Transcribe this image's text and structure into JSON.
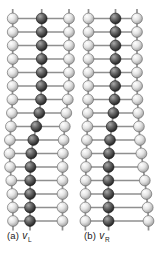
{
  "figure": {
    "width": 160,
    "height": 254,
    "sphere_radius": 5.4,
    "bond_width": 1.7,
    "stub_length": 9.5,
    "colors": {
      "background": "#ffffff",
      "bond": "#8f8f8f",
      "light_sphere_base": "#d9d9d9",
      "light_sphere_edge": "#5f5f5f",
      "dark_sphere_base": "#3a3a3a",
      "dark_sphere_edge": "#141414",
      "caption_text": "#1a1a1a"
    },
    "panels": [
      {
        "id": "a",
        "caption": {
          "prefix": "(a)",
          "symbol": "v",
          "subscript": "L"
        },
        "rungs": [
          {
            "y": 18.5,
            "left": 12.7,
            "dark": 41.7,
            "right": 69.0
          },
          {
            "y": 32.0,
            "left": 12.7,
            "dark": 41.7,
            "right": 69.0
          },
          {
            "y": 45.5,
            "left": 12.7,
            "dark": 41.7,
            "right": 69.0
          },
          {
            "y": 59.0,
            "left": 12.7,
            "dark": 41.7,
            "right": 69.0
          },
          {
            "y": 72.5,
            "left": 12.7,
            "dark": 41.7,
            "right": 69.0
          },
          {
            "y": 86.0,
            "left": 12.6,
            "dark": 41.5,
            "right": 68.9
          },
          {
            "y": 99.5,
            "left": 12.4,
            "dark": 41.0,
            "right": 67.8
          },
          {
            "y": 113.0,
            "left": 11.9,
            "dark": 39.3,
            "right": 66.3
          },
          {
            "y": 126.5,
            "left": 10.9,
            "dark": 36.3,
            "right": 64.8
          },
          {
            "y": 140.0,
            "left": 9.9,
            "dark": 33.3,
            "right": 63.6
          },
          {
            "y": 153.5,
            "left": 9.5,
            "dark": 31.3,
            "right": 62.9
          },
          {
            "y": 167.0,
            "left": 10.1,
            "dark": 30.5,
            "right": 62.6
          },
          {
            "y": 180.5,
            "left": 11.3,
            "dark": 30.2,
            "right": 62.5
          },
          {
            "y": 194.0,
            "left": 12.3,
            "dark": 30.1,
            "right": 62.5
          },
          {
            "y": 207.5,
            "left": 12.8,
            "dark": 30.0,
            "right": 62.5
          },
          {
            "y": 221.0,
            "left": 13.0,
            "dark": 30.0,
            "right": 62.5
          }
        ]
      },
      {
        "id": "b",
        "caption": {
          "prefix": "(b)",
          "symbol": "v",
          "subscript": "R"
        },
        "rungs": [
          {
            "y": 18.5,
            "left": 88.5,
            "dark": 115.5,
            "right": 137.0
          },
          {
            "y": 32.0,
            "left": 88.5,
            "dark": 115.5,
            "right": 137.0
          },
          {
            "y": 45.5,
            "left": 88.5,
            "dark": 115.5,
            "right": 137.0
          },
          {
            "y": 59.0,
            "left": 88.5,
            "dark": 115.5,
            "right": 137.0
          },
          {
            "y": 72.5,
            "left": 88.4,
            "dark": 115.4,
            "right": 137.0
          },
          {
            "y": 86.0,
            "left": 88.3,
            "dark": 115.2,
            "right": 137.1
          },
          {
            "y": 99.5,
            "left": 88.1,
            "dark": 114.6,
            "right": 137.4
          },
          {
            "y": 113.0,
            "left": 87.8,
            "dark": 113.4,
            "right": 138.2
          },
          {
            "y": 126.5,
            "left": 87.4,
            "dark": 111.7,
            "right": 138.9
          },
          {
            "y": 140.0,
            "left": 86.9,
            "dark": 110.0,
            "right": 140.0
          },
          {
            "y": 153.5,
            "left": 86.4,
            "dark": 109.0,
            "right": 141.4
          },
          {
            "y": 167.0,
            "left": 86.0,
            "dark": 108.6,
            "right": 143.1
          },
          {
            "y": 180.5,
            "left": 85.7,
            "dark": 108.4,
            "right": 144.8
          },
          {
            "y": 194.0,
            "left": 85.5,
            "dark": 108.4,
            "right": 146.4
          },
          {
            "y": 207.5,
            "left": 85.4,
            "dark": 108.5,
            "right": 147.7
          },
          {
            "y": 221.0,
            "left": 85.4,
            "dark": 108.6,
            "right": 148.5
          }
        ]
      }
    ]
  }
}
